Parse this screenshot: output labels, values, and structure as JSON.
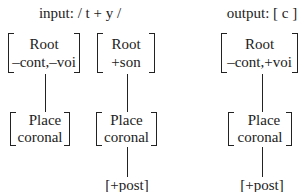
{
  "input": {
    "title": "input: / t + y /",
    "segments": [
      {
        "root": {
          "line1": "Root",
          "line2": "–cont,–voi"
        },
        "place": {
          "line1": "Place",
          "line2": "coronal"
        },
        "dependent": null
      },
      {
        "root": {
          "line1": "Root",
          "line2": "+son"
        },
        "place": {
          "line1": "Place",
          "line2": "coronal"
        },
        "dependent": "[+post]"
      }
    ]
  },
  "output": {
    "title": "output: [ c ]",
    "segments": [
      {
        "root": {
          "line1": "Root",
          "line2": "–cont,+voi"
        },
        "place": {
          "line1": "Place",
          "line2": "coronal"
        },
        "dependent": "[+post]"
      }
    ]
  }
}
